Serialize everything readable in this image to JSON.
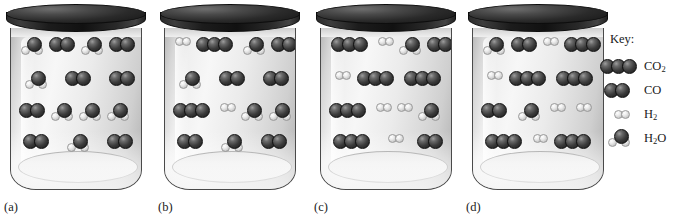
{
  "figure": {
    "background_color": "#ffffff",
    "panel_count": 4
  },
  "key": {
    "title": "Key:",
    "entries": [
      {
        "label": "CO2",
        "formula_main": "CO",
        "formula_sub": "2",
        "glyph": "co2-molecule-icon",
        "atoms": [
          "dark",
          "dark",
          "dark"
        ]
      },
      {
        "label": "CO",
        "formula_main": "CO",
        "formula_sub": "",
        "glyph": "co-molecule-icon",
        "atoms": [
          "dark",
          "dark"
        ]
      },
      {
        "label": "H2",
        "formula_main": "H",
        "formula_sub": "2",
        "glyph": "h2-molecule-icon",
        "atoms": [
          "light",
          "light"
        ]
      },
      {
        "label": "H2O",
        "formula_main": "H",
        "formula_sub": "2",
        "formula_tail": "O",
        "glyph": "h2o-molecule-icon",
        "atoms": [
          "dark",
          "light",
          "light"
        ]
      }
    ]
  },
  "panels": [
    {
      "label": "(a)",
      "name": "jar-a",
      "lid_color": "#1c1c1c",
      "contents": {
        "CO2": 0,
        "CO": 7,
        "H2": 0,
        "H2O": 7
      },
      "rows": [
        [
          "H2O",
          "CO",
          "H2O",
          "CO"
        ],
        [
          "H2O",
          "CO",
          "CO"
        ],
        [
          "CO",
          "H2O",
          "H2O",
          "H2O"
        ],
        [
          "CO",
          "H2O",
          "CO"
        ]
      ]
    },
    {
      "label": "(b)",
      "name": "jar-b",
      "lid_color": "#1c1c1c",
      "contents": {
        "CO2": 2,
        "CO": 5,
        "H2": 2,
        "H2O": 5
      },
      "rows": [
        [
          "H2",
          "CO2",
          "H2O",
          "CO"
        ],
        [
          "H2O",
          "CO",
          "CO"
        ],
        [
          "CO2",
          "H2",
          "H2O",
          "H2O"
        ],
        [
          "CO",
          "H2O",
          "CO"
        ]
      ]
    },
    {
      "label": "(c)",
      "name": "jar-c",
      "lid_color": "#1c1c1c",
      "contents": {
        "CO2": 5,
        "CO": 2,
        "H2": 5,
        "H2O": 2
      },
      "rows": [
        [
          "CO2",
          "H2",
          "H2O",
          "CO"
        ],
        [
          "H2",
          "CO2",
          "CO2"
        ],
        [
          "CO2",
          "H2",
          "H2",
          "H2O"
        ],
        [
          "CO2",
          "H2",
          "CO"
        ]
      ]
    },
    {
      "label": "(d)",
      "name": "jar-d",
      "lid_color": "#1c1c1c",
      "contents": {
        "CO2": 6,
        "CO": 2,
        "H2": 6,
        "H2O": 2
      },
      "rows": [
        [
          "H2O",
          "CO",
          "H2",
          "CO2"
        ],
        [
          "H2",
          "CO2",
          "CO2"
        ],
        [
          "CO",
          "H2O",
          "H2",
          "H2"
        ],
        [
          "CO2",
          "H2",
          "CO2"
        ]
      ]
    }
  ]
}
